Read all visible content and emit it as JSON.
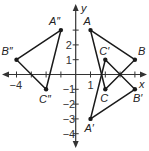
{
  "diagram": {
    "type": "coordinate-plane",
    "axes": {
      "x_label": "x",
      "y_label": "y",
      "x_range": [
        -4,
        4
      ],
      "y_range": [
        -4,
        3
      ]
    },
    "tick_labels": {
      "x": [
        {
          "v": -4,
          "text": "−4"
        },
        {
          "v": 1,
          "text": "1"
        }
      ],
      "y": [
        {
          "v": 2,
          "text": "2"
        },
        {
          "v": 1,
          "text": "1"
        },
        {
          "v": -1,
          "text": "−1"
        },
        {
          "v": -2,
          "text": "−2"
        },
        {
          "v": -3,
          "text": "−3"
        },
        {
          "v": -4,
          "text": "−4"
        }
      ]
    },
    "triangles": [
      {
        "name": "ABC",
        "points": [
          {
            "label": "A",
            "x": 1,
            "y": 3
          },
          {
            "label": "B",
            "x": 4,
            "y": 1
          },
          {
            "label": "C",
            "x": 2,
            "y": -1
          }
        ]
      },
      {
        "name": "A'B'C'",
        "points": [
          {
            "label": "A′",
            "x": 1,
            "y": -3
          },
          {
            "label": "B′",
            "x": 4,
            "y": -1
          },
          {
            "label": "C′",
            "x": 2,
            "y": 1
          }
        ]
      },
      {
        "name": "A''B''C''",
        "points": [
          {
            "label": "A″",
            "x": -1,
            "y": 3
          },
          {
            "label": "B″",
            "x": -4,
            "y": 1
          },
          {
            "label": "C″",
            "x": -2,
            "y": -1
          }
        ]
      }
    ],
    "colors": {
      "line": "#1a1a1a",
      "axis": "#333333"
    }
  }
}
